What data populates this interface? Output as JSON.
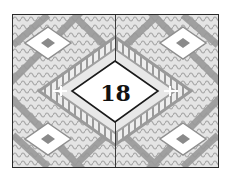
{
  "card": {
    "number": "18",
    "pattern": "decorative-geometric-diamond",
    "colors": {
      "frame": "#2a2a2a",
      "pattern_dark": "#8f8f8f",
      "pattern_mid": "#b5b5b5",
      "pattern_light": "#e6e6e6",
      "center_fill": "#ffffff",
      "number": "#111111"
    }
  }
}
